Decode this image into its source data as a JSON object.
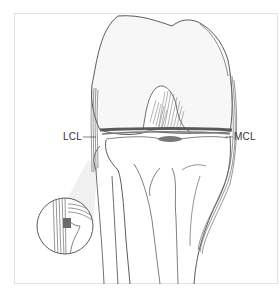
{
  "figure": {
    "labels": {
      "lcl": "LCL",
      "mcl": "MCL"
    },
    "inset": "magnified view of lateral collateral ligament attachment"
  },
  "colors": {
    "outline": "#4a4a4a",
    "bone_fill": "#f7f7f7",
    "ligament": "#6b6b6b",
    "shadow": "#e9e9e9",
    "frame": "#e2e2e2"
  }
}
